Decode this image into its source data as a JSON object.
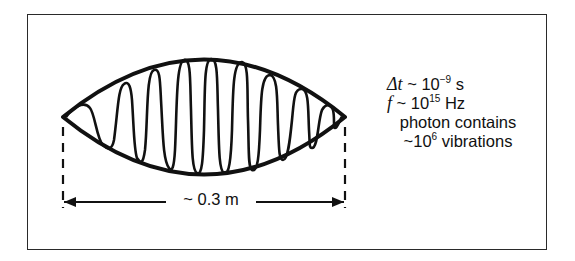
{
  "diagram": {
    "type": "photon wave packet",
    "envelope_color": "#111111",
    "wave_color": "#111111",
    "width_label": "~ 0.3 m",
    "annotations": {
      "delta_t": {
        "symbol": "Δt",
        "approx": "~",
        "base": "10",
        "exponent": "−9",
        "unit": "s"
      },
      "frequency": {
        "symbol": "f",
        "approx": "~",
        "base": "10",
        "exponent": "15",
        "unit": "Hz"
      },
      "line3": "photon contains",
      "line4": {
        "approx": "~",
        "base": "10",
        "exponent": "6",
        "text": "vibrations"
      }
    }
  }
}
